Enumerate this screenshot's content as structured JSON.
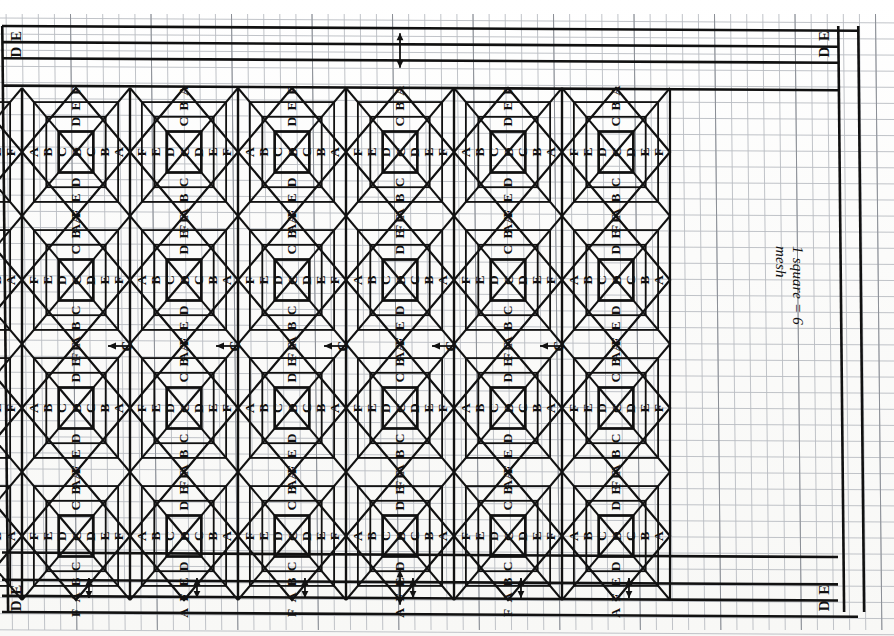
{
  "document": {
    "type": "hand-drawn needlepoint / bargello pattern chart on graph paper",
    "title": "Needlepoint star block repeat chart",
    "annotation": "1 square = 6 mesh",
    "mesh_per_square": 6
  },
  "grid": {
    "cell_px": 16.1,
    "cols": 55,
    "rows": 38,
    "minor_color": "#b9bcc2",
    "major_color": "#1a1a1a",
    "paper_color": "#fdfdfd"
  },
  "frame": {
    "left_px": 2,
    "top_px": 26,
    "right_px": 838,
    "bottom_px": 612,
    "border_color": "#111111",
    "border_width_px": 2.6
  },
  "pattern": {
    "block_count_horizontal": 6,
    "block_count_vertical": 4,
    "block_width_px": 108,
    "block_height_px": 128,
    "origin_x_px": 22,
    "origin_y_px": 88,
    "letters": [
      "A",
      "B",
      "C",
      "D",
      "E",
      "F"
    ],
    "sequence_outward_from_center": [
      "C",
      "D",
      "E",
      "F"
    ],
    "alternation_note": "Columns alternate between an A-B-C-D core family and an F-E-D-C core family; rows alternate likewise.",
    "family_A": {
      "name": "ABCD-core block",
      "horizontal_row": [
        "A",
        "B",
        "C",
        "D",
        "C",
        "B",
        "A"
      ],
      "above_center": [
        "D",
        "E",
        "F"
      ],
      "below_center": [
        "D",
        "E",
        "F",
        "A"
      ],
      "center_letter": "D"
    },
    "family_B": {
      "name": "FEDC-core block",
      "horizontal_row": [
        "F",
        "E",
        "D",
        "C",
        "D",
        "E",
        "F"
      ],
      "above_center": [
        "C",
        "B",
        "A"
      ],
      "below_center": [
        "C",
        "B",
        "A",
        "F"
      ],
      "center_letter": "C"
    },
    "junction_label": "C",
    "junction_label_count": 5
  },
  "border_strips": {
    "top": {
      "outer_letter": "E",
      "inner_letter": "D",
      "shown_at": [
        "far-left",
        "far-right"
      ]
    },
    "bottom": {
      "outer_letter": "E",
      "inner_letter": "D",
      "shown_at": [
        "far-left",
        "far-right"
      ]
    }
  },
  "arrows": {
    "vertical_pairs_top": 1,
    "vertical_pairs_bottom": 1,
    "horizontal_count_midline": 5,
    "description": "double-headed repeat-measure arrows marking one block unit",
    "color": "#111111"
  },
  "legend": {
    "text": "1 square = 6 mesh"
  },
  "colors": {
    "ink": "#111111",
    "minor_grid": "#b9bcc2",
    "paper": "#fdfdfd"
  }
}
